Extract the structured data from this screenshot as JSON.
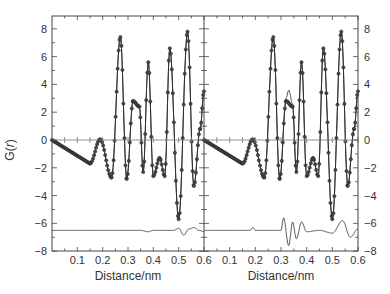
{
  "chart_data": [
    {
      "type": "line",
      "panel": "left",
      "title": "",
      "xlabel": "Distance/nm",
      "ylabel": "G(r)",
      "xlim": [
        0,
        0.6
      ],
      "ylim": [
        -8,
        9
      ],
      "x_ticks": [
        "0.1",
        "0.2",
        "0.3",
        "0.4",
        "0.5",
        "0.6"
      ],
      "y_ticks": [
        "8",
        "6",
        "4",
        "2",
        "0",
        "-2",
        "-4",
        "-6",
        "-8"
      ],
      "grid": false,
      "series": [
        {
          "name": "experimental (markers)",
          "style": "circles",
          "x": [
            0.0,
            0.15,
            0.19,
            0.235,
            0.27,
            0.295,
            0.32,
            0.345,
            0.36,
            0.38,
            0.4,
            0.425,
            0.445,
            0.465,
            0.5,
            0.535,
            0.56,
            0.585,
            0.6
          ],
          "y": [
            0,
            -1.7,
            0.05,
            -2.7,
            7.4,
            -2.8,
            2.8,
            2.4,
            -2.3,
            5.6,
            -2.6,
            -1.3,
            -2.6,
            6.6,
            -5.7,
            7.8,
            -3.3,
            0.8,
            3.5
          ]
        },
        {
          "name": "calculated (line)",
          "style": "line",
          "x": [
            0.0,
            0.15,
            0.19,
            0.235,
            0.27,
            0.295,
            0.32,
            0.345,
            0.36,
            0.38,
            0.4,
            0.425,
            0.445,
            0.465,
            0.5,
            0.535,
            0.56,
            0.585,
            0.6
          ],
          "y": [
            0,
            -1.7,
            0.05,
            -2.7,
            7.4,
            -2.8,
            2.8,
            2.4,
            -2.3,
            5.6,
            -2.6,
            -1.3,
            -2.6,
            6.6,
            -5.7,
            7.8,
            -3.3,
            0.8,
            3.5
          ]
        },
        {
          "name": "difference (offset -6.5)",
          "style": "line",
          "x": [
            0.0,
            0.35,
            0.38,
            0.4,
            0.45,
            0.48,
            0.5,
            0.52,
            0.54,
            0.56,
            0.58,
            0.6
          ],
          "y": [
            -6.5,
            -6.5,
            -6.6,
            -6.5,
            -6.5,
            -6.5,
            -6.35,
            -6.85,
            -6.4,
            -6.3,
            -6.5,
            -6.6
          ]
        }
      ]
    },
    {
      "type": "line",
      "panel": "right",
      "title": "",
      "xlabel": "Distance/nm",
      "ylabel": "",
      "xlim": [
        0,
        0.6
      ],
      "ylim": [
        -8,
        9
      ],
      "x_ticks": [
        "0.1",
        "0.2",
        "0.3",
        "0.4",
        "0.5",
        "0.6"
      ],
      "y_ticks": [
        "8",
        "6",
        "4",
        "2",
        "0",
        "-2",
        "-4",
        "-6",
        "-8"
      ],
      "grid": false,
      "series": [
        {
          "name": "experimental (markers)",
          "style": "circles",
          "x": [
            0.0,
            0.15,
            0.19,
            0.235,
            0.27,
            0.295,
            0.32,
            0.345,
            0.36,
            0.38,
            0.4,
            0.425,
            0.445,
            0.465,
            0.5,
            0.535,
            0.56,
            0.585,
            0.6
          ],
          "y": [
            0,
            -1.7,
            0.05,
            -2.7,
            7.4,
            -2.8,
            2.8,
            2.4,
            -2.3,
            5.6,
            -2.6,
            -1.3,
            -2.6,
            6.6,
            -5.7,
            7.8,
            -3.3,
            0.8,
            3.5
          ]
        },
        {
          "name": "calculated (line)",
          "style": "line",
          "x": [
            0.0,
            0.15,
            0.19,
            0.235,
            0.27,
            0.295,
            0.32,
            0.33,
            0.345,
            0.36,
            0.38,
            0.4,
            0.425,
            0.445,
            0.465,
            0.5,
            0.535,
            0.56,
            0.585,
            0.6
          ],
          "y": [
            0,
            -1.7,
            0.05,
            -2.7,
            7.4,
            -2.8,
            3.0,
            3.6,
            2.6,
            -2.3,
            5.6,
            -2.6,
            -1.3,
            -2.6,
            6.6,
            -5.7,
            7.8,
            -3.3,
            0.8,
            3.5
          ]
        },
        {
          "name": "difference (offset -6.5)",
          "style": "line",
          "x": [
            0.0,
            0.18,
            0.19,
            0.2,
            0.3,
            0.31,
            0.33,
            0.345,
            0.36,
            0.38,
            0.4,
            0.45,
            0.5,
            0.54,
            0.57,
            0.6
          ],
          "y": [
            -6.5,
            -6.5,
            -6.3,
            -6.5,
            -6.5,
            -5.6,
            -7.6,
            -5.9,
            -7.1,
            -5.9,
            -6.6,
            -6.5,
            -6.7,
            -5.8,
            -7.0,
            -6.4
          ]
        }
      ]
    }
  ],
  "axes": {
    "xlabel": "Distance/nm",
    "ylabel": "G(r)",
    "x_ticks": [
      "0.1",
      "0.2",
      "0.3",
      "0.4",
      "0.5",
      "0.6"
    ],
    "y_ticks": [
      "8",
      "6",
      "4",
      "2",
      "0",
      "−2",
      "−4",
      "−6",
      "−8"
    ]
  }
}
